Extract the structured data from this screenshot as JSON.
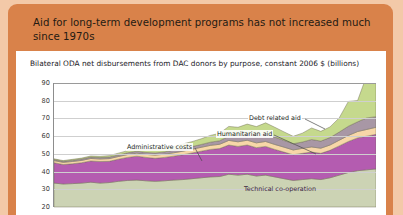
{
  "header": {
    "title": "Aid for long-term development programs has not increased much since 1970s"
  },
  "card": {
    "subtitle": "Bilateral ODA net disbursements from DAC donors by purpose, constant 2006 $ (billions)"
  },
  "annotations": {
    "debt": "Debt related aid",
    "humanitarian": "Humanitarian aid",
    "administrative": "Administrative costs",
    "technical": "Technical co-operation"
  },
  "colors": {
    "page_background": "#f3c9a8",
    "panel": "#d9824a",
    "card": "#ffffff",
    "grid": "#cfcfcf",
    "axis": "#8d8d8d",
    "development": "#ccd3b4",
    "technical": "#b45cb0",
    "administrative": "#f7d7a8",
    "humanitarian": "#a897a5",
    "debt": "#c5d98d",
    "stroke": "#6f6b55"
  },
  "chart_data": {
    "type": "area",
    "stacked": true,
    "title": "Bilateral ODA net disbursements from DAC donors by purpose, constant 2006 $ (billions)",
    "xlabel": "",
    "ylabel": "constant 2006 $ (billions)",
    "ylim": [
      20,
      90
    ],
    "yticks": [
      20,
      30,
      40,
      50,
      60,
      70,
      80,
      90
    ],
    "grid": true,
    "legend": "annotations-inline",
    "x": [
      1971,
      1972,
      1973,
      1974,
      1975,
      1976,
      1977,
      1978,
      1979,
      1980,
      1981,
      1982,
      1983,
      1984,
      1985,
      1986,
      1987,
      1988,
      1989,
      1990,
      1991,
      1992,
      1993,
      1994,
      1995,
      1996,
      1997,
      1998,
      1999,
      2000,
      2001,
      2002,
      2003,
      2004,
      2005,
      2006
    ],
    "series": [
      {
        "name": "Development programs and projects",
        "color": "#ccd3b4",
        "values": [
          13.5,
          13.0,
          13.2,
          13.5,
          14.0,
          13.5,
          13.8,
          14.5,
          15.0,
          15.2,
          14.8,
          14.5,
          14.8,
          15.2,
          15.5,
          16.0,
          16.5,
          17.0,
          17.2,
          18.5,
          18.0,
          18.5,
          17.5,
          18.0,
          17.0,
          16.0,
          15.0,
          15.5,
          16.0,
          15.5,
          16.5,
          18.0,
          19.5,
          20.5,
          21.0,
          21.5
        ]
      },
      {
        "name": "Technical co-operation",
        "color": "#b45cb0",
        "values": [
          11.5,
          11.0,
          11.2,
          11.5,
          12.0,
          12.2,
          12.0,
          12.5,
          13.0,
          13.5,
          13.2,
          13.0,
          13.2,
          13.5,
          14.0,
          14.5,
          15.0,
          15.5,
          15.8,
          16.5,
          16.2,
          16.5,
          16.0,
          16.2,
          15.5,
          15.0,
          14.5,
          14.8,
          15.0,
          14.8,
          15.5,
          16.5,
          17.5,
          18.5,
          19.0,
          19.5
        ]
      },
      {
        "name": "Administrative costs",
        "color": "#f7d7a8",
        "values": [
          1.2,
          1.2,
          1.3,
          1.3,
          1.4,
          1.4,
          1.5,
          1.5,
          1.6,
          1.7,
          1.7,
          1.8,
          1.8,
          1.9,
          2.0,
          2.1,
          2.2,
          2.3,
          2.4,
          2.6,
          2.6,
          2.7,
          2.7,
          2.8,
          2.8,
          2.8,
          2.7,
          2.8,
          2.9,
          2.9,
          3.0,
          3.2,
          3.4,
          3.6,
          3.8,
          4.0
        ]
      },
      {
        "name": "Humanitarian aid",
        "color": "#a897a5",
        "values": [
          0.6,
          0.6,
          0.7,
          0.8,
          0.8,
          0.8,
          0.9,
          0.9,
          1.0,
          1.1,
          1.1,
          1.2,
          1.3,
          1.5,
          1.6,
          1.5,
          1.6,
          1.8,
          2.0,
          2.4,
          3.2,
          3.6,
          4.0,
          4.5,
          4.2,
          3.8,
          3.5,
          3.6,
          4.2,
          4.0,
          4.2,
          4.6,
          5.2,
          5.5,
          6.5,
          6.0
        ]
      },
      {
        "name": "Debt related aid",
        "color": "#c5d98d",
        "values": [
          0.4,
          0.4,
          0.5,
          0.5,
          0.6,
          0.7,
          0.8,
          1.0,
          1.2,
          1.5,
          1.6,
          1.8,
          2.0,
          2.2,
          2.5,
          2.8,
          3.2,
          3.8,
          4.2,
          5.5,
          5.0,
          5.5,
          5.2,
          6.0,
          5.5,
          4.8,
          4.2,
          5.0,
          6.5,
          5.5,
          6.0,
          8.0,
          14.0,
          12.0,
          24.0,
          18.5
        ]
      }
    ]
  }
}
